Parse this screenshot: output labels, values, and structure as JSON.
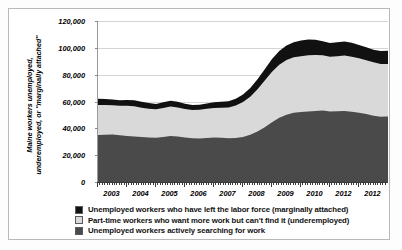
{
  "chart_data": {
    "type": "area",
    "stacked": true,
    "title": "",
    "xlabel": "",
    "ylabel": "Maine workers unemployed, underemployed, or \"marginally attached\"",
    "ylabel_lines": [
      "Maine workers unemployed,",
      "underemployed, or \"marginally attached\""
    ],
    "ylim": [
      0,
      120000
    ],
    "ytick_values": [
      0,
      20000,
      40000,
      60000,
      80000,
      100000,
      120000
    ],
    "ytick_labels": [
      "0",
      "20,000",
      "40,000",
      "60,000",
      "80,000",
      "100,000",
      "120,000"
    ],
    "grid": true,
    "legend_position": "below",
    "xlim": [
      2003,
      2013
    ],
    "xtick_labels": [
      "2003",
      "2004",
      "2005",
      "2006",
      "2007",
      "2008",
      "2009",
      "2010",
      "2012",
      "2012"
    ],
    "xtick_positions": [
      2003.5,
      2004.5,
      2005.5,
      2006.5,
      2007.5,
      2008.5,
      2009.5,
      2010.5,
      2011.5,
      2012.5
    ],
    "minor_ticks_per_year": 12,
    "x": [
      2003.0,
      2003.25,
      2003.5,
      2003.75,
      2004.0,
      2004.25,
      2004.5,
      2004.75,
      2005.0,
      2005.25,
      2005.5,
      2005.75,
      2006.0,
      2006.25,
      2006.5,
      2006.75,
      2007.0,
      2007.25,
      2007.5,
      2007.75,
      2008.0,
      2008.25,
      2008.5,
      2008.75,
      2009.0,
      2009.25,
      2009.5,
      2009.75,
      2010.0,
      2010.25,
      2010.5,
      2010.75,
      2011.0,
      2011.25,
      2011.5,
      2011.75,
      2012.0,
      2012.25,
      2012.5,
      2012.75,
      2013.0
    ],
    "series": [
      {
        "name": "Unemployed workers actively searching for work",
        "color": "#4a4a4a",
        "stack_order": 1,
        "values": [
          35000,
          35200,
          35400,
          34800,
          34200,
          34000,
          33600,
          33200,
          33000,
          33600,
          34200,
          34000,
          33200,
          32600,
          32400,
          32800,
          33200,
          33000,
          32600,
          32800,
          33600,
          35200,
          37600,
          40800,
          44600,
          47800,
          50200,
          51600,
          52200,
          52600,
          53000,
          53200,
          52600,
          52800,
          53000,
          52400,
          51600,
          50600,
          49400,
          48600,
          48800
        ]
      },
      {
        "name": "Part-time workers who want more work but can't find it (underemployed)",
        "color": "#d9d9d9",
        "stack_order": 2,
        "values": [
          22400,
          22200,
          21800,
          22000,
          22600,
          22400,
          21800,
          21400,
          21200,
          21600,
          22000,
          21600,
          21200,
          21000,
          21400,
          21800,
          22000,
          22400,
          23000,
          24200,
          26000,
          28400,
          31600,
          34800,
          37600,
          39600,
          40800,
          41400,
          41600,
          41800,
          41600,
          41200,
          40800,
          41000,
          41200,
          41000,
          40600,
          40200,
          39800,
          39400,
          39200
        ]
      },
      {
        "name": "Unemployed workers who have left the labor force (marginally attached)",
        "color": "#111111",
        "stack_order": 3,
        "values": [
          4600,
          4400,
          4200,
          4200,
          4400,
          4600,
          4400,
          4200,
          4000,
          4200,
          4400,
          4200,
          4000,
          3800,
          3800,
          4000,
          4200,
          4400,
          4600,
          5000,
          5600,
          6400,
          7400,
          8400,
          9400,
          10200,
          10800,
          11200,
          11600,
          11800,
          11400,
          10600,
          10200,
          10400,
          10600,
          10400,
          10000,
          9600,
          9400,
          9600,
          9800
        ]
      }
    ],
    "totals_note": {
      "start_2003": 62000,
      "peak_2010": 105000,
      "end_2012": 98000
    }
  },
  "legend": {
    "items": [
      {
        "label": "Unemployed workers who have left the labor force (marginally attached)",
        "color": "#111111"
      },
      {
        "label": "Part-time workers who want more work but can't find it (underemployed)",
        "color": "#d9d9d9"
      },
      {
        "label": "Unemployed workers actively searching for work",
        "color": "#4a4a4a"
      }
    ]
  }
}
